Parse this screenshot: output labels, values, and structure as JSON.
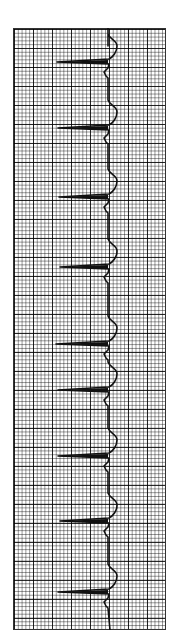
{
  "caption": "",
  "chart_data": {
    "type": "line",
    "title": "",
    "orientation": "vertical",
    "xlabel": "",
    "ylabel": "",
    "grid": true,
    "beats": [
      {
        "index": 1,
        "y_px": 62,
        "tip_x_px": 57
      },
      {
        "index": 2,
        "y_px": 128,
        "tip_x_px": 58
      },
      {
        "index": 3,
        "y_px": 197,
        "tip_x_px": 59
      },
      {
        "index": 4,
        "y_px": 267,
        "tip_x_px": 60
      },
      {
        "index": 5,
        "y_px": 344,
        "tip_x_px": 56
      },
      {
        "index": 6,
        "y_px": 390,
        "tip_x_px": 58
      },
      {
        "index": 7,
        "y_px": 456,
        "tip_x_px": 58
      },
      {
        "index": 8,
        "y_px": 521,
        "tip_x_px": 60
      },
      {
        "index": 9,
        "y_px": 592,
        "tip_x_px": 58
      }
    ],
    "baseline_x_px": 108,
    "trace_color": "#111111",
    "grid_color": "#555555"
  }
}
